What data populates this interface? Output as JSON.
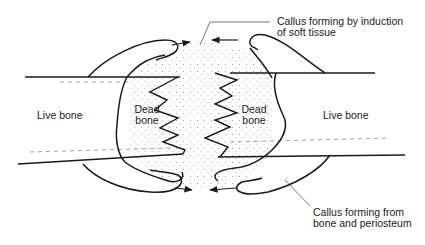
{
  "diagram": {
    "type": "bone-fracture-callus-formation",
    "labels": {
      "live_bone_left": "Live bone",
      "dead_bone_left_1": "Dead",
      "dead_bone_left_2": "bone",
      "dead_bone_right_1": "Dead",
      "dead_bone_right_2": "bone",
      "live_bone_right": "Live bone",
      "callus_top_1": "Callus forming by induction",
      "callus_top_2": "of soft tissue",
      "callus_bottom_1": "Callus forming from",
      "callus_bottom_2": "bone and periosteum"
    },
    "colors": {
      "stroke": "#1a1a1a",
      "stipple": "#9a9a9a",
      "background": "#ffffff"
    }
  }
}
